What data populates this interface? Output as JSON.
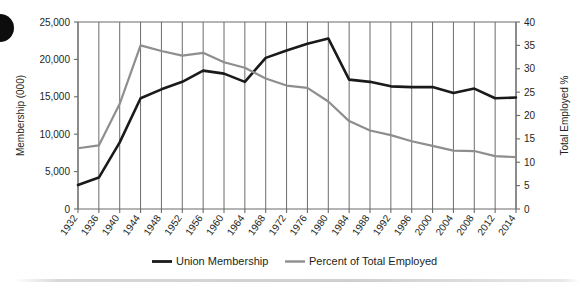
{
  "chart_data": {
    "type": "line",
    "title": "",
    "xlabel": "",
    "ylabel": "Membership (000)",
    "y2label": "Total Employed %",
    "grid": "vertical",
    "legend_position": "bottom",
    "ylim": [
      0,
      25000
    ],
    "y2lim": [
      0,
      40
    ],
    "yticks": [
      "0",
      "5,000",
      "10,000",
      "15,000",
      "20,000",
      "25,000"
    ],
    "ytick_values": [
      0,
      5000,
      10000,
      15000,
      20000,
      25000
    ],
    "y2ticks": [
      "0",
      "5",
      "10",
      "15",
      "20",
      "25",
      "30",
      "35",
      "40"
    ],
    "y2tick_values": [
      0,
      5,
      10,
      15,
      20,
      25,
      30,
      35,
      40
    ],
    "categories": [
      "1932",
      "1936",
      "1940",
      "1944",
      "1948",
      "1952",
      "1956",
      "1960",
      "1964",
      "1968",
      "1972",
      "1976",
      "1980",
      "1984",
      "1988",
      "1992",
      "1996",
      "2000",
      "2004",
      "2008",
      "2012",
      "2014"
    ],
    "series": [
      {
        "name": "Union Membership",
        "axis": "left",
        "color": "#1a1a1a",
        "values": [
          3200,
          4200,
          8900,
          14800,
          16000,
          17000,
          18500,
          18100,
          17000,
          20200,
          21200,
          22100,
          22800,
          17300,
          17000,
          16400,
          16300,
          16300,
          15500,
          16100,
          14800,
          14900
        ]
      },
      {
        "name": "Percent of Total Employed",
        "axis": "right",
        "color": "#8e8e8e",
        "values": [
          13.0,
          13.6,
          22.5,
          35.0,
          33.8,
          32.8,
          33.4,
          31.4,
          30.2,
          27.9,
          26.4,
          25.9,
          23.0,
          18.8,
          16.8,
          15.8,
          14.5,
          13.5,
          12.5,
          12.4,
          11.3,
          11.1
        ]
      }
    ],
    "legend": [
      {
        "label": "Union Membership",
        "color": "#1a1a1a"
      },
      {
        "label": "Percent of Total Employed",
        "color": "#8e8e8e"
      }
    ]
  }
}
